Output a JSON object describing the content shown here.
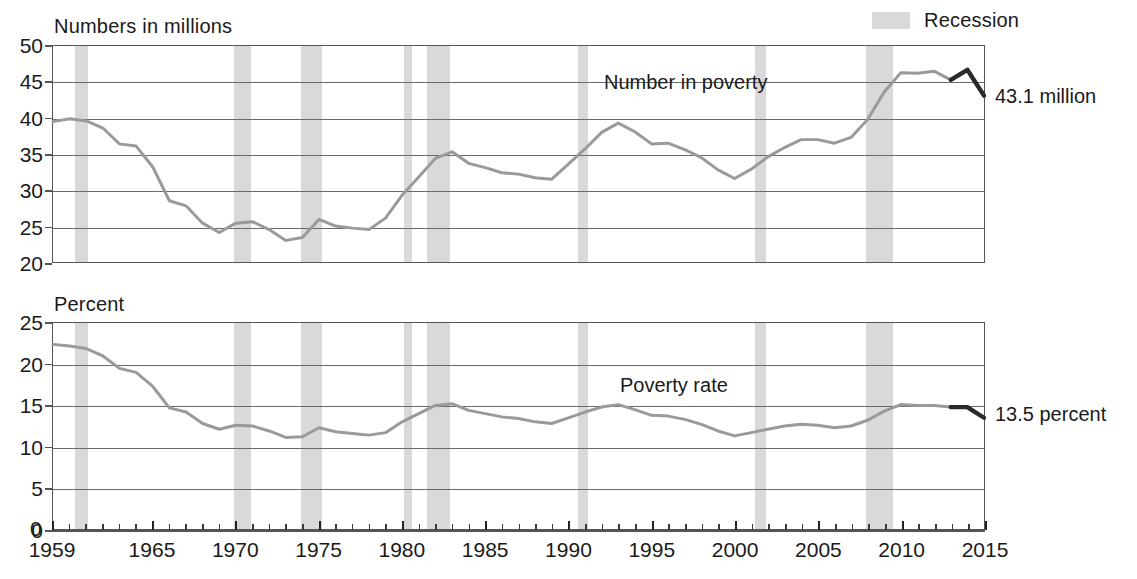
{
  "legend": {
    "label": "Recession",
    "swatch_color": "#d9d9d9"
  },
  "panels": {
    "top": {
      "axis_title": "Numbers in millions",
      "series_label": "Number in poverty",
      "end_annotation": "43.1 million"
    },
    "bottom": {
      "axis_title": "Percent",
      "series_label": "Poverty rate",
      "end_annotation": "13.5 percent"
    }
  },
  "axis": {
    "zero_label": "0",
    "x_labels": [
      "1959",
      "1965",
      "1970",
      "1975",
      "1980",
      "1985",
      "1990",
      "1995",
      "2000",
      "2005",
      "2010",
      "2015"
    ],
    "y_labels_top": [
      "50",
      "45",
      "40",
      "35",
      "30",
      "25",
      "20"
    ],
    "y_labels_bottom": [
      "25",
      "20",
      "15",
      "10",
      "5",
      "0"
    ]
  },
  "chart_data": {
    "type": "line",
    "title": "",
    "xlabel": "",
    "xlim": [
      1959,
      2015
    ],
    "grid": true,
    "legend_position": "top-right",
    "recessions": [
      {
        "start": 1960.3,
        "end": 1961.1
      },
      {
        "start": 1969.9,
        "end": 1970.9
      },
      {
        "start": 1973.9,
        "end": 1975.2
      },
      {
        "start": 1980.1,
        "end": 1980.6
      },
      {
        "start": 1981.5,
        "end": 1982.9
      },
      {
        "start": 1990.6,
        "end": 1991.2
      },
      {
        "start": 2001.2,
        "end": 2001.9
      },
      {
        "start": 2007.9,
        "end": 2009.5
      }
    ],
    "panels": [
      {
        "name": "Number in poverty",
        "ylabel": "Numbers in millions",
        "ylim": [
          20,
          50
        ],
        "yticks": [
          20,
          25,
          30,
          35,
          40,
          45,
          50
        ],
        "end_value": 43.1,
        "end_label": "43.1 million",
        "x": [
          1959,
          1960,
          1961,
          1962,
          1963,
          1964,
          1965,
          1966,
          1967,
          1968,
          1969,
          1970,
          1971,
          1972,
          1973,
          1974,
          1975,
          1976,
          1977,
          1978,
          1979,
          1980,
          1981,
          1982,
          1983,
          1984,
          1985,
          1986,
          1987,
          1988,
          1989,
          1990,
          1991,
          1992,
          1993,
          1994,
          1995,
          1996,
          1997,
          1998,
          1999,
          2000,
          2001,
          2002,
          2003,
          2004,
          2005,
          2006,
          2007,
          2008,
          2009,
          2010,
          2011,
          2012,
          2013,
          2014,
          2015
        ],
        "values": [
          39.5,
          39.9,
          39.6,
          38.6,
          36.4,
          36.1,
          33.2,
          28.5,
          27.8,
          25.4,
          24.1,
          25.4,
          25.6,
          24.5,
          23.0,
          23.4,
          25.9,
          25.0,
          24.7,
          24.5,
          26.1,
          29.3,
          31.8,
          34.4,
          35.3,
          33.7,
          33.1,
          32.4,
          32.2,
          31.7,
          31.5,
          33.6,
          35.7,
          38.0,
          39.3,
          38.1,
          36.4,
          36.5,
          35.6,
          34.5,
          32.8,
          31.6,
          32.9,
          34.6,
          35.9,
          37.0,
          37.0,
          36.5,
          37.3,
          39.8,
          43.6,
          46.3,
          46.2,
          46.5,
          45.3,
          46.7,
          43.1
        ],
        "recent_split_year": 2013
      },
      {
        "name": "Poverty rate",
        "ylabel": "Percent",
        "ylim": [
          0,
          25
        ],
        "yticks": [
          0,
          5,
          10,
          15,
          20,
          25
        ],
        "end_value": 13.5,
        "end_label": "13.5 percent",
        "x": [
          1959,
          1960,
          1961,
          1962,
          1963,
          1964,
          1965,
          1966,
          1967,
          1968,
          1969,
          1970,
          1971,
          1972,
          1973,
          1974,
          1975,
          1976,
          1977,
          1978,
          1979,
          1980,
          1981,
          1982,
          1983,
          1984,
          1985,
          1986,
          1987,
          1988,
          1989,
          1990,
          1991,
          1992,
          1993,
          1994,
          1995,
          1996,
          1997,
          1998,
          1999,
          2000,
          2001,
          2002,
          2003,
          2004,
          2005,
          2006,
          2007,
          2008,
          2009,
          2010,
          2011,
          2012,
          2013,
          2014,
          2015
        ],
        "values": [
          22.4,
          22.2,
          21.9,
          21.0,
          19.5,
          19.0,
          17.3,
          14.7,
          14.2,
          12.8,
          12.1,
          12.6,
          12.5,
          11.9,
          11.1,
          11.2,
          12.3,
          11.8,
          11.6,
          11.4,
          11.7,
          13.0,
          14.0,
          15.0,
          15.2,
          14.4,
          14.0,
          13.6,
          13.4,
          13.0,
          12.8,
          13.5,
          14.2,
          14.8,
          15.1,
          14.5,
          13.8,
          13.7,
          13.3,
          12.7,
          11.9,
          11.3,
          11.7,
          12.1,
          12.5,
          12.7,
          12.6,
          12.3,
          12.5,
          13.2,
          14.3,
          15.1,
          15.0,
          15.0,
          14.8,
          14.8,
          13.5
        ],
        "recent_split_year": 2013
      }
    ]
  }
}
